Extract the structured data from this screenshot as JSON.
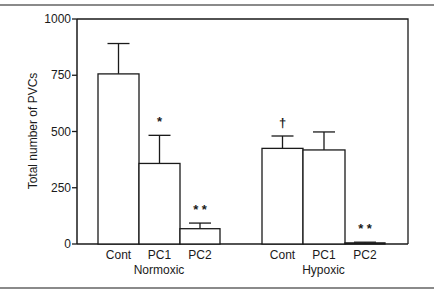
{
  "chart_data": {
    "type": "bar",
    "title": "",
    "xlabel": "",
    "ylabel": "Total number of PVCs",
    "ylim": [
      0,
      1000
    ],
    "yticks": [
      0,
      250,
      500,
      750,
      1000
    ],
    "grid": false,
    "legend": null,
    "groups": [
      {
        "name": "Normoxic",
        "bars": [
          {
            "category": "Cont",
            "value": 756,
            "error": 135,
            "annotation": ""
          },
          {
            "category": "PC1",
            "value": 358,
            "error": 125,
            "annotation": "*"
          },
          {
            "category": "PC2",
            "value": 68,
            "error": 25,
            "annotation": "* *"
          }
        ]
      },
      {
        "name": "Hypoxic",
        "bars": [
          {
            "category": "Cont",
            "value": 425,
            "error": 55,
            "annotation": "†"
          },
          {
            "category": "PC1",
            "value": 418,
            "error": 80,
            "annotation": ""
          },
          {
            "category": "PC2",
            "value": 5,
            "error": 3,
            "annotation": "* *"
          }
        ]
      }
    ],
    "categories": [
      "Cont",
      "PC1",
      "PC2",
      "Cont",
      "PC1",
      "PC2"
    ],
    "values": [
      756,
      358,
      68,
      425,
      418,
      5
    ],
    "errors": [
      135,
      125,
      25,
      55,
      80,
      3
    ]
  },
  "colors": {
    "bar_fill": "#ffffff",
    "bar_stroke": "#1a1a1a",
    "axis": "#1a1a1a",
    "rule": "#8a8a8a"
  }
}
